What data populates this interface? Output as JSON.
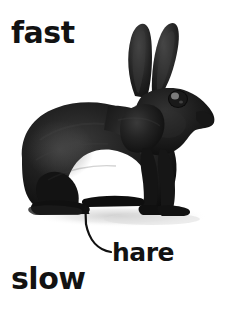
{
  "image": {
    "type": "photograph-illustration",
    "subject": "hare",
    "background_color": "#ffffff",
    "width": 227,
    "height": 319
  },
  "labels": {
    "top_left": "fast",
    "bottom_left": "slow",
    "callout": "hare"
  },
  "colors": {
    "text": "#121212",
    "animal_body": "#1a1a1a",
    "animal_shadow": "#d8d8d8",
    "background": "#ffffff",
    "leader_line": "#111111"
  },
  "annotation": {
    "leader_line_name": "callout-leader-line",
    "arrow_target": "rabbit-rear-foot",
    "arrow_tip_x": 85,
    "arrow_tip_y": 206,
    "line_end_x": 112,
    "line_end_y": 253
  },
  "figure": {
    "name": "black-rabbit-photo",
    "alt": "Side view of a black hare sitting",
    "parts": [
      "ears",
      "head",
      "eye",
      "nose",
      "body",
      "front-legs",
      "rear-leg",
      "rear-foot",
      "tail",
      "ground-shadow"
    ]
  }
}
